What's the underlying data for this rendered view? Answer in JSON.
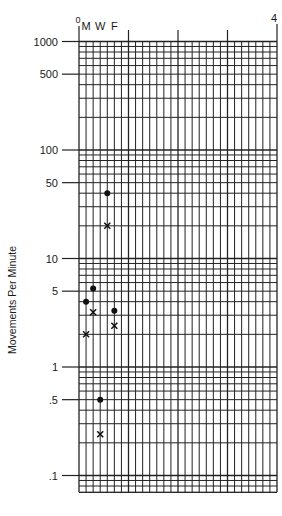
{
  "chart_data": {
    "type": "scatter",
    "title": "",
    "xlabel": "",
    "ylabel": "Movements Per Minute",
    "y_scale": "log",
    "ylim": [
      0.07,
      1000
    ],
    "y_tick_labels": [
      {
        "value": 1000,
        "label": "1000"
      },
      {
        "value": 500,
        "label": "500"
      },
      {
        "value": 100,
        "label": "100"
      },
      {
        "value": 50,
        "label": "50"
      },
      {
        "value": 10,
        "label": "10"
      },
      {
        "value": 5,
        "label": "5"
      },
      {
        "value": 1,
        "label": "1"
      },
      {
        "value": 0.5,
        "label": ".5"
      },
      {
        "value": 0.1,
        "label": ".1"
      }
    ],
    "x_range": [
      0,
      28
    ],
    "x_major_ticks": [
      {
        "value": 0,
        "label": "0"
      },
      {
        "value": 7,
        "label": ""
      },
      {
        "value": 14,
        "label": ""
      },
      {
        "value": 21,
        "label": ""
      },
      {
        "value": 28,
        "label": "4"
      }
    ],
    "x_day_labels": [
      {
        "day": 1,
        "label": "M"
      },
      {
        "day": 3,
        "label": "W"
      },
      {
        "day": 5,
        "label": "F"
      }
    ],
    "grid": true,
    "series": [
      {
        "name": "dot",
        "marker": "circle",
        "points": [
          {
            "x": 1,
            "y": 4
          },
          {
            "x": 2,
            "y": 5.3
          },
          {
            "x": 3,
            "y": 0.5
          },
          {
            "x": 4,
            "y": 40
          },
          {
            "x": 5,
            "y": 3.3
          }
        ]
      },
      {
        "name": "x",
        "marker": "x",
        "points": [
          {
            "x": 1,
            "y": 2
          },
          {
            "x": 2,
            "y": 3.2
          },
          {
            "x": 3,
            "y": 0.24
          },
          {
            "x": 4,
            "y": 20
          },
          {
            "x": 5,
            "y": 2.4
          }
        ]
      }
    ]
  },
  "labels": {
    "y_axis_title": "Movements Per Minute"
  }
}
